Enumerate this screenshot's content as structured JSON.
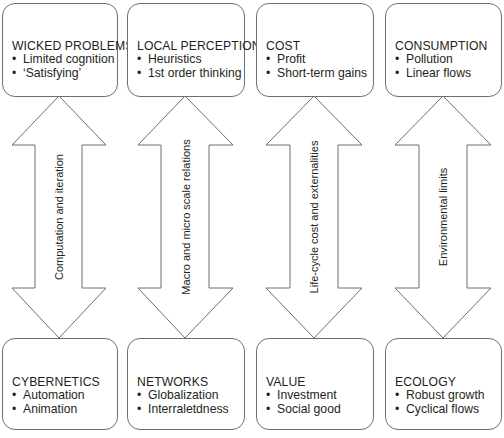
{
  "diagram": {
    "columns": [
      {
        "top": {
          "title": "WICKED PROBLEMS",
          "items": [
            "Limited cognition",
            "‘Satisfying’"
          ]
        },
        "arrow_label": "Computation and iteration",
        "bottom": {
          "title": "CYBERNETICS",
          "items": [
            "Automation",
            "Animation"
          ]
        }
      },
      {
        "top": {
          "title": "LOCAL PERCEPTION",
          "items": [
            "Heuristics",
            "1st order thinking"
          ]
        },
        "arrow_label": "Macro and micro scale relations",
        "bottom": {
          "title": "NETWORKS",
          "items": [
            "Globalization",
            "Interraletdness"
          ]
        }
      },
      {
        "top": {
          "title": "COST",
          "items": [
            "Profit",
            "Short-term gains"
          ]
        },
        "arrow_label": "Life-cycle cost and externalities",
        "bottom": {
          "title": "VALUE",
          "items": [
            "Investment",
            "Social good"
          ]
        }
      },
      {
        "top": {
          "title": "CONSUMPTION",
          "items": [
            "Pollution",
            "Linear flows"
          ]
        },
        "arrow_label": "Environmental limits",
        "bottom": {
          "title": "ECOLOGY",
          "items": [
            "Robust growth",
            "Cyclical flows"
          ]
        }
      }
    ],
    "colors": {
      "stroke": "#6d6e71",
      "text": "#231f20",
      "background": "#ffffff"
    }
  }
}
